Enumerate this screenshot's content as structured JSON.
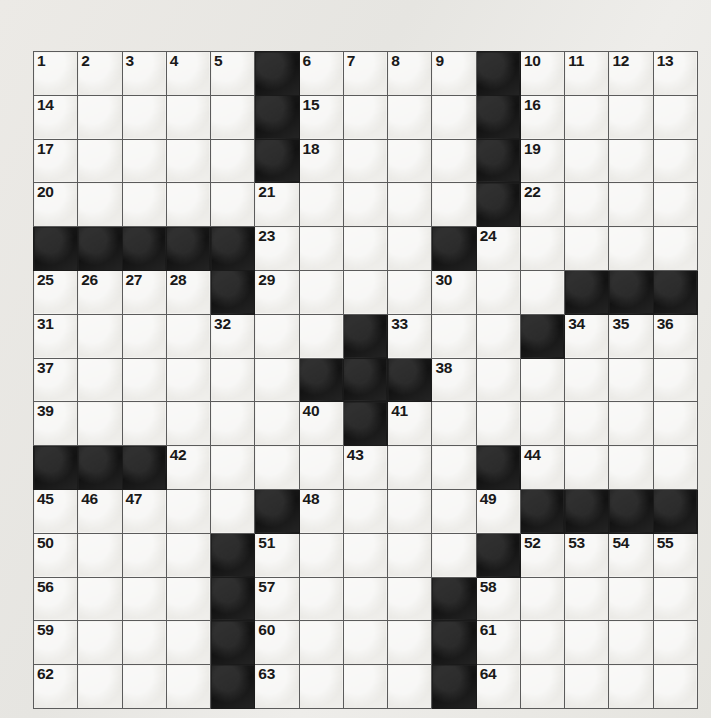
{
  "puzzle": {
    "type": "crossword-grid",
    "title": "Crossword Puzzle Grid",
    "rows": 15,
    "columns": 15,
    "total_clue_numbers": 64,
    "colors": {
      "paper": "#e9e8e4",
      "white_cell": "#edece8",
      "black_cell": "#181818",
      "grid_line": "#5b5b5b",
      "border": "#4a4a4a",
      "number_text": "#191919"
    },
    "grid": [
      [
        {
          "n": "1",
          "b": false
        },
        {
          "n": "2",
          "b": false
        },
        {
          "n": "3",
          "b": false
        },
        {
          "n": "4",
          "b": false
        },
        {
          "n": "5",
          "b": false
        },
        {
          "n": "",
          "b": true
        },
        {
          "n": "6",
          "b": false
        },
        {
          "n": "7",
          "b": false
        },
        {
          "n": "8",
          "b": false
        },
        {
          "n": "9",
          "b": false
        },
        {
          "n": "",
          "b": true
        },
        {
          "n": "10",
          "b": false
        },
        {
          "n": "11",
          "b": false
        },
        {
          "n": "12",
          "b": false
        },
        {
          "n": "13",
          "b": false
        }
      ],
      [
        {
          "n": "14",
          "b": false
        },
        {
          "n": "",
          "b": false
        },
        {
          "n": "",
          "b": false
        },
        {
          "n": "",
          "b": false
        },
        {
          "n": "",
          "b": false
        },
        {
          "n": "",
          "b": true
        },
        {
          "n": "15",
          "b": false
        },
        {
          "n": "",
          "b": false
        },
        {
          "n": "",
          "b": false
        },
        {
          "n": "",
          "b": false
        },
        {
          "n": "",
          "b": true
        },
        {
          "n": "16",
          "b": false
        },
        {
          "n": "",
          "b": false
        },
        {
          "n": "",
          "b": false
        },
        {
          "n": "",
          "b": false
        }
      ],
      [
        {
          "n": "17",
          "b": false
        },
        {
          "n": "",
          "b": false
        },
        {
          "n": "",
          "b": false
        },
        {
          "n": "",
          "b": false
        },
        {
          "n": "",
          "b": false
        },
        {
          "n": "",
          "b": true
        },
        {
          "n": "18",
          "b": false
        },
        {
          "n": "",
          "b": false
        },
        {
          "n": "",
          "b": false
        },
        {
          "n": "",
          "b": false
        },
        {
          "n": "",
          "b": true
        },
        {
          "n": "19",
          "b": false
        },
        {
          "n": "",
          "b": false
        },
        {
          "n": "",
          "b": false
        },
        {
          "n": "",
          "b": false
        }
      ],
      [
        {
          "n": "20",
          "b": false
        },
        {
          "n": "",
          "b": false
        },
        {
          "n": "",
          "b": false
        },
        {
          "n": "",
          "b": false
        },
        {
          "n": "",
          "b": false
        },
        {
          "n": "21",
          "b": false
        },
        {
          "n": "",
          "b": false
        },
        {
          "n": "",
          "b": false
        },
        {
          "n": "",
          "b": false
        },
        {
          "n": "",
          "b": false
        },
        {
          "n": "",
          "b": true
        },
        {
          "n": "22",
          "b": false
        },
        {
          "n": "",
          "b": false
        },
        {
          "n": "",
          "b": false
        },
        {
          "n": "",
          "b": false
        }
      ],
      [
        {
          "n": "",
          "b": true
        },
        {
          "n": "",
          "b": true
        },
        {
          "n": "",
          "b": true
        },
        {
          "n": "",
          "b": true
        },
        {
          "n": "",
          "b": true
        },
        {
          "n": "23",
          "b": false
        },
        {
          "n": "",
          "b": false
        },
        {
          "n": "",
          "b": false
        },
        {
          "n": "",
          "b": false
        },
        {
          "n": "",
          "b": true
        },
        {
          "n": "24",
          "b": false
        },
        {
          "n": "",
          "b": false
        },
        {
          "n": "",
          "b": false
        },
        {
          "n": "",
          "b": false
        },
        {
          "n": "",
          "b": false
        }
      ],
      [
        {
          "n": "25",
          "b": false
        },
        {
          "n": "26",
          "b": false
        },
        {
          "n": "27",
          "b": false
        },
        {
          "n": "28",
          "b": false
        },
        {
          "n": "",
          "b": true
        },
        {
          "n": "29",
          "b": false
        },
        {
          "n": "",
          "b": false
        },
        {
          "n": "",
          "b": false
        },
        {
          "n": "",
          "b": false
        },
        {
          "n": "30",
          "b": false
        },
        {
          "n": "",
          "b": false
        },
        {
          "n": "",
          "b": false
        },
        {
          "n": "",
          "b": true
        },
        {
          "n": "",
          "b": true
        },
        {
          "n": "",
          "b": true
        }
      ],
      [
        {
          "n": "31",
          "b": false
        },
        {
          "n": "",
          "b": false
        },
        {
          "n": "",
          "b": false
        },
        {
          "n": "",
          "b": false
        },
        {
          "n": "32",
          "b": false
        },
        {
          "n": "",
          "b": false
        },
        {
          "n": "",
          "b": false
        },
        {
          "n": "",
          "b": true
        },
        {
          "n": "33",
          "b": false
        },
        {
          "n": "",
          "b": false
        },
        {
          "n": "",
          "b": false
        },
        {
          "n": "",
          "b": true
        },
        {
          "n": "34",
          "b": false
        },
        {
          "n": "35",
          "b": false
        },
        {
          "n": "36",
          "b": false
        }
      ],
      [
        {
          "n": "37",
          "b": false
        },
        {
          "n": "",
          "b": false
        },
        {
          "n": "",
          "b": false
        },
        {
          "n": "",
          "b": false
        },
        {
          "n": "",
          "b": false
        },
        {
          "n": "",
          "b": false
        },
        {
          "n": "",
          "b": true
        },
        {
          "n": "",
          "b": true
        },
        {
          "n": "",
          "b": true
        },
        {
          "n": "38",
          "b": false
        },
        {
          "n": "",
          "b": false
        },
        {
          "n": "",
          "b": false
        },
        {
          "n": "",
          "b": false
        },
        {
          "n": "",
          "b": false
        },
        {
          "n": "",
          "b": false
        }
      ],
      [
        {
          "n": "39",
          "b": false
        },
        {
          "n": "",
          "b": false
        },
        {
          "n": "",
          "b": false
        },
        {
          "n": "",
          "b": false
        },
        {
          "n": "",
          "b": false
        },
        {
          "n": "",
          "b": false
        },
        {
          "n": "40",
          "b": false
        },
        {
          "n": "",
          "b": true
        },
        {
          "n": "41",
          "b": false
        },
        {
          "n": "",
          "b": false
        },
        {
          "n": "",
          "b": false
        },
        {
          "n": "",
          "b": false
        },
        {
          "n": "",
          "b": false
        },
        {
          "n": "",
          "b": false
        },
        {
          "n": "",
          "b": false
        }
      ],
      [
        {
          "n": "",
          "b": true
        },
        {
          "n": "",
          "b": true
        },
        {
          "n": "",
          "b": true
        },
        {
          "n": "42",
          "b": false
        },
        {
          "n": "",
          "b": false
        },
        {
          "n": "",
          "b": false
        },
        {
          "n": "",
          "b": false
        },
        {
          "n": "43",
          "b": false
        },
        {
          "n": "",
          "b": false
        },
        {
          "n": "",
          "b": false
        },
        {
          "n": "",
          "b": true
        },
        {
          "n": "44",
          "b": false
        },
        {
          "n": "",
          "b": false
        },
        {
          "n": "",
          "b": false
        },
        {
          "n": "",
          "b": false
        }
      ],
      [
        {
          "n": "45",
          "b": false
        },
        {
          "n": "46",
          "b": false
        },
        {
          "n": "47",
          "b": false
        },
        {
          "n": "",
          "b": false
        },
        {
          "n": "",
          "b": false
        },
        {
          "n": "",
          "b": true
        },
        {
          "n": "48",
          "b": false
        },
        {
          "n": "",
          "b": false
        },
        {
          "n": "",
          "b": false
        },
        {
          "n": "",
          "b": false
        },
        {
          "n": "49",
          "b": false
        },
        {
          "n": "",
          "b": true
        },
        {
          "n": "",
          "b": true
        },
        {
          "n": "",
          "b": true
        },
        {
          "n": "",
          "b": true
        }
      ],
      [
        {
          "n": "50",
          "b": false
        },
        {
          "n": "",
          "b": false
        },
        {
          "n": "",
          "b": false
        },
        {
          "n": "",
          "b": false
        },
        {
          "n": "",
          "b": true
        },
        {
          "n": "51",
          "b": false
        },
        {
          "n": "",
          "b": false
        },
        {
          "n": "",
          "b": false
        },
        {
          "n": "",
          "b": false
        },
        {
          "n": "",
          "b": false
        },
        {
          "n": "",
          "b": true
        },
        {
          "n": "52",
          "b": false
        },
        {
          "n": "53",
          "b": false
        },
        {
          "n": "54",
          "b": false
        },
        {
          "n": "55",
          "b": false
        }
      ],
      [
        {
          "n": "56",
          "b": false
        },
        {
          "n": "",
          "b": false
        },
        {
          "n": "",
          "b": false
        },
        {
          "n": "",
          "b": false
        },
        {
          "n": "",
          "b": true
        },
        {
          "n": "57",
          "b": false
        },
        {
          "n": "",
          "b": false
        },
        {
          "n": "",
          "b": false
        },
        {
          "n": "",
          "b": false
        },
        {
          "n": "",
          "b": true
        },
        {
          "n": "58",
          "b": false
        },
        {
          "n": "",
          "b": false
        },
        {
          "n": "",
          "b": false
        },
        {
          "n": "",
          "b": false
        },
        {
          "n": "",
          "b": false
        }
      ],
      [
        {
          "n": "59",
          "b": false
        },
        {
          "n": "",
          "b": false
        },
        {
          "n": "",
          "b": false
        },
        {
          "n": "",
          "b": false
        },
        {
          "n": "",
          "b": true
        },
        {
          "n": "60",
          "b": false
        },
        {
          "n": "",
          "b": false
        },
        {
          "n": "",
          "b": false
        },
        {
          "n": "",
          "b": false
        },
        {
          "n": "",
          "b": true
        },
        {
          "n": "61",
          "b": false
        },
        {
          "n": "",
          "b": false
        },
        {
          "n": "",
          "b": false
        },
        {
          "n": "",
          "b": false
        },
        {
          "n": "",
          "b": false
        }
      ],
      [
        {
          "n": "62",
          "b": false
        },
        {
          "n": "",
          "b": false
        },
        {
          "n": "",
          "b": false
        },
        {
          "n": "",
          "b": false
        },
        {
          "n": "",
          "b": true
        },
        {
          "n": "63",
          "b": false
        },
        {
          "n": "",
          "b": false
        },
        {
          "n": "",
          "b": false
        },
        {
          "n": "",
          "b": false
        },
        {
          "n": "",
          "b": true
        },
        {
          "n": "64",
          "b": false
        },
        {
          "n": "",
          "b": false
        },
        {
          "n": "",
          "b": false
        },
        {
          "n": "",
          "b": false
        },
        {
          "n": "",
          "b": false
        }
      ]
    ]
  }
}
